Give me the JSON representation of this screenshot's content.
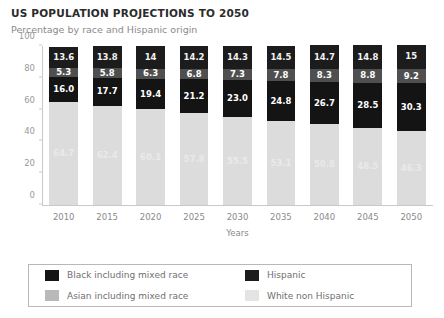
{
  "chart_data": {
    "type": "bar",
    "subtype": "stacked-bar-100",
    "title": "US POPULATION PROJECTIONS TO 2050",
    "subtitle": "Percentage by race and Hispanic origin",
    "xlabel": "Years",
    "ylabel": "",
    "ylim": [
      0,
      100
    ],
    "yticks": [
      0,
      20,
      40,
      60,
      80,
      100
    ],
    "ytick_labels": [
      "0",
      "20",
      "40",
      "60",
      "80",
      "100"
    ],
    "grid": false,
    "legend_position": "bottom",
    "categories": [
      "2010",
      "2015",
      "2020",
      "2025",
      "2030",
      "2035",
      "2040",
      "2045",
      "2050"
    ],
    "series": [
      {
        "name": "White non Hispanic",
        "key": "white",
        "color": "#dcdcdc",
        "values": [
          64.7,
          62.4,
          60.1,
          57.8,
          55.5,
          53.1,
          50.8,
          48.5,
          46.3
        ],
        "labels": [
          "64.7",
          "62.4",
          "60.1",
          "57.8",
          "55.5",
          "53.1",
          "50.8",
          "48.5",
          "46.3"
        ]
      },
      {
        "name": "Black including mixed race",
        "key": "black",
        "color": "#141414",
        "values": [
          16.0,
          17.7,
          19.4,
          21.2,
          23.0,
          24.8,
          26.7,
          28.5,
          30.3
        ],
        "labels": [
          "16.0",
          "17.7",
          "19.4",
          "21.2",
          "23.0",
          "24.8",
          "26.7",
          "28.5",
          "30.3"
        ]
      },
      {
        "name": "Asian including mixed race",
        "key": "asian",
        "color": "#4f4f4f",
        "values": [
          5.3,
          5.8,
          6.3,
          6.8,
          7.3,
          7.8,
          8.3,
          8.8,
          9.2
        ],
        "labels": [
          "5.3",
          "5.8",
          "6.3",
          "6.8",
          "7.3",
          "7.8",
          "8.3",
          "8.8",
          "9.2"
        ]
      },
      {
        "name": "Hispanic",
        "key": "hispanic",
        "color": "#1c1c1c",
        "values": [
          13.6,
          13.8,
          14.0,
          14.2,
          14.3,
          14.5,
          14.7,
          14.8,
          15.0
        ],
        "labels": [
          "13.6",
          "13.8",
          "14",
          "14.2",
          "14.3",
          "14.5",
          "14.7",
          "14.8",
          "15"
        ]
      }
    ]
  },
  "legend": {
    "entries": [
      {
        "label": "Black including mixed race",
        "key": "black"
      },
      {
        "label": "Hispanic",
        "key": "hispanic"
      },
      {
        "label": "Asian including mixed race",
        "key": "asian"
      },
      {
        "label": "White non Hispanic",
        "key": "white"
      }
    ]
  }
}
